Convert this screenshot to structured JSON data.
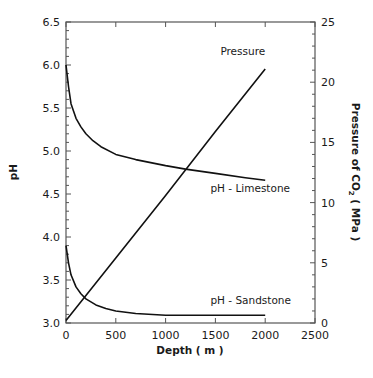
{
  "chart_data": {
    "type": "line",
    "title": "",
    "xlabel": "Depth  ( m )",
    "ylabel": "pH",
    "y2label": "Pressure of CO",
    "y2label_sub": "2",
    "y2label_unit": "  ( MPa )",
    "xlim": [
      0,
      2500
    ],
    "ylim": [
      3.0,
      6.5
    ],
    "y2lim": [
      0,
      25
    ],
    "xticks": [
      0,
      500,
      1000,
      1500,
      2000,
      2500
    ],
    "xtick_labels": [
      "0",
      "500",
      "1000",
      "1500",
      "2000",
      "2500"
    ],
    "yticks": [
      3.0,
      3.5,
      4.0,
      4.5,
      5.0,
      5.5,
      6.0,
      6.5
    ],
    "ytick_labels": [
      "3.0",
      "3.5",
      "4.0",
      "4.5",
      "5.0",
      "5.5",
      "6.0",
      "6.5"
    ],
    "y2ticks": [
      0,
      5,
      10,
      15,
      20,
      25
    ],
    "y2tick_labels": [
      "0",
      "5",
      "10",
      "15",
      "20",
      "25"
    ],
    "grid": false,
    "legend": "inline annotations",
    "series": [
      {
        "name": "pH - Limestone",
        "axis": "left",
        "x": [
          0,
          25,
          50,
          100,
          150,
          200,
          270,
          350,
          500,
          700,
          1000,
          1200,
          1500,
          1800,
          2000
        ],
        "values": [
          6.0,
          5.75,
          5.55,
          5.38,
          5.28,
          5.2,
          5.12,
          5.05,
          4.96,
          4.9,
          4.83,
          4.79,
          4.74,
          4.69,
          4.66
        ]
      },
      {
        "name": "pH - Sandstone",
        "axis": "left",
        "x": [
          0,
          25,
          50,
          100,
          150,
          200,
          300,
          400,
          500,
          700,
          1000,
          1500,
          2000
        ],
        "values": [
          3.9,
          3.7,
          3.56,
          3.42,
          3.34,
          3.28,
          3.21,
          3.17,
          3.14,
          3.11,
          3.09,
          3.09,
          3.09
        ]
      },
      {
        "name": "Pressure",
        "axis": "right",
        "x": [
          0,
          500,
          1000,
          1500,
          2000
        ],
        "values": [
          0.2,
          5.4,
          10.6,
          15.9,
          21.1
        ]
      }
    ],
    "annotations": [
      {
        "text": "Pressure",
        "x": 1550,
        "y2": 22.3
      },
      {
        "text": "pH - Limestone",
        "x": 1450,
        "y": 4.52
      },
      {
        "text": "pH - Sandstone",
        "x": 1450,
        "y": 3.22
      }
    ]
  }
}
